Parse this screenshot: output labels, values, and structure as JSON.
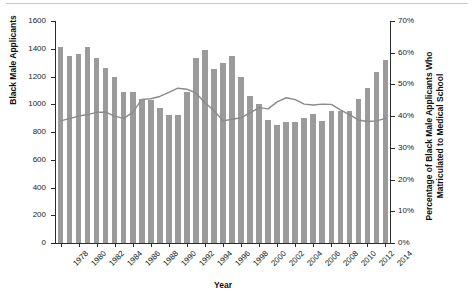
{
  "chart_data": {
    "type": "bar",
    "title": "",
    "subtitle": "",
    "xlabel": "Year",
    "ylabel": "Black Male Applicants",
    "y2label": "Percentage of Black Male Applicants Who Matriculated to Medical School",
    "grid": false,
    "legend": "none",
    "ylim": [
      0,
      1600
    ],
    "y2lim": [
      0,
      70
    ],
    "ytick_labels": [
      "0",
      "200",
      "400",
      "600",
      "800",
      "1000",
      "1200",
      "1400",
      "1600"
    ],
    "ytick_values": [
      0,
      200,
      400,
      600,
      800,
      1000,
      1200,
      1400,
      1600
    ],
    "y2tick_labels": [
      "0%",
      "10%",
      "20%",
      "30%",
      "40%",
      "50%",
      "60%",
      "70%"
    ],
    "y2tick_values": [
      0,
      10,
      20,
      30,
      40,
      50,
      60,
      70
    ],
    "xtick_labels": [
      "1978",
      "1980",
      "1982",
      "1984",
      "1986",
      "1988",
      "1990",
      "1992",
      "1994",
      "1996",
      "1998",
      "2000",
      "2002",
      "2004",
      "2006",
      "2008",
      "2010",
      "2012",
      "2014"
    ],
    "categories": [
      "1978",
      "1979",
      "1980",
      "1981",
      "1982",
      "1983",
      "1984",
      "1985",
      "1986",
      "1987",
      "1988",
      "1989",
      "1990",
      "1991",
      "1992",
      "1993",
      "1994",
      "1995",
      "1996",
      "1997",
      "1998",
      "1999",
      "2000",
      "2001",
      "2002",
      "2003",
      "2004",
      "2005",
      "2006",
      "2007",
      "2008",
      "2009",
      "2010",
      "2011",
      "2012",
      "2013",
      "2014"
    ],
    "series": [
      {
        "name": "Black Male Applicants",
        "axis": "left",
        "kind": "bar",
        "color": "#9b9b9b",
        "values": [
          1410,
          1350,
          1362,
          1410,
          1330,
          1260,
          1198,
          1090,
          1092,
          1040,
          1030,
          975,
          920,
          920,
          1090,
          1330,
          1390,
          1255,
          1300,
          1350,
          1195,
          1060,
          1000,
          890,
          850,
          875,
          870,
          900,
          930,
          880,
          950,
          955,
          950,
          1040,
          1115,
          1230,
          1320
        ]
      },
      {
        "name": "Percentage of Black Male Applicants Who Matriculated to Medical School",
        "axis": "right",
        "kind": "line",
        "color": "#8a8a8a",
        "values": [
          38.5,
          39.2,
          40.0,
          40.5,
          41.2,
          41.3,
          40.0,
          39.3,
          41.2,
          45.3,
          45.5,
          46.2,
          47.5,
          48.8,
          48.5,
          47.3,
          44.2,
          41.8,
          38.5,
          39.0,
          39.5,
          41.0,
          42.7,
          42.3,
          44.5,
          45.8,
          45.2,
          43.8,
          43.5,
          43.8,
          43.7,
          42.0,
          40.5,
          38.8,
          38.3,
          38.5,
          39.3
        ]
      }
    ]
  }
}
